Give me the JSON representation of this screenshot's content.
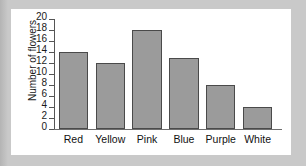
{
  "chart_data": {
    "type": "bar",
    "title": "",
    "xlabel": "",
    "ylabel": "Number of flowers",
    "categories": [
      "Red",
      "Yellow",
      "Pink",
      "Blue",
      "Purple",
      "White"
    ],
    "values": [
      14,
      12,
      18,
      13,
      8,
      4
    ],
    "ylim": [
      0,
      20
    ],
    "ytick_step": 2,
    "yticks": [
      20,
      18,
      16,
      14,
      12,
      10,
      8,
      6,
      4,
      2,
      0
    ],
    "grid": false,
    "legend": false,
    "bar_color": "#9b9b9b",
    "bar_border_color": "#4a4a4a",
    "axis_color": "#555555",
    "plot_background": "#ffffff",
    "page_background": "#c9c9c9"
  }
}
